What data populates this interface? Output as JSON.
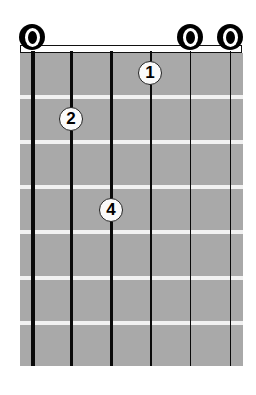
{
  "diagram": {
    "type": "guitar-chord-chart",
    "strings": 6,
    "frets_shown": 7,
    "colors": {
      "fretboard": "#a9a9a9",
      "fret_line": "#f2f2f2",
      "string": "#0a0a0a",
      "marker_fill": "#fafafa"
    },
    "open_strings": [
      {
        "string": 1,
        "symbol": "O"
      },
      {
        "string": 5,
        "symbol": "O"
      },
      {
        "string": 6,
        "symbol": "O"
      }
    ],
    "fingers": [
      {
        "label": "1",
        "string": 4,
        "fret": 1
      },
      {
        "label": "2",
        "string": 2,
        "fret": 2
      },
      {
        "label": "4",
        "string": 3,
        "fret": 4
      }
    ]
  }
}
